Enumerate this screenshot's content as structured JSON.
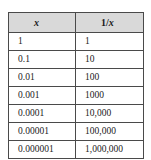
{
  "table": {
    "headers": {
      "col1": "x",
      "col2_prefix": "1/",
      "col2_var": "x",
      "col2_full": "1/x"
    },
    "rows": [
      {
        "x": "1",
        "reciprocal": "1"
      },
      {
        "x": "0.1",
        "reciprocal": "10"
      },
      {
        "x": "0.01",
        "reciprocal": "100"
      },
      {
        "x": "0.001",
        "reciprocal": "1000"
      },
      {
        "x": "0.0001",
        "reciprocal": "10,000"
      },
      {
        "x": "0.00001",
        "reciprocal": "100,000"
      },
      {
        "x": "0.000001",
        "reciprocal": "1,000,000"
      }
    ]
  },
  "chart_data": {
    "type": "table",
    "title": "",
    "columns": [
      "x",
      "1/x"
    ],
    "x": [
      "1",
      "0.1",
      "0.01",
      "0.001",
      "0.0001",
      "0.00001",
      "0.000001"
    ],
    "values": [
      "1",
      "10",
      "100",
      "1000",
      "10,000",
      "100,000",
      "1,000,000"
    ],
    "xlabel": "x",
    "ylabel": "1/x"
  },
  "style": {
    "header_bg": "#d9d9d9",
    "border_color": "#4a4a4a",
    "text_color": "#1a1a1a",
    "page_bg": "#ffffff"
  }
}
